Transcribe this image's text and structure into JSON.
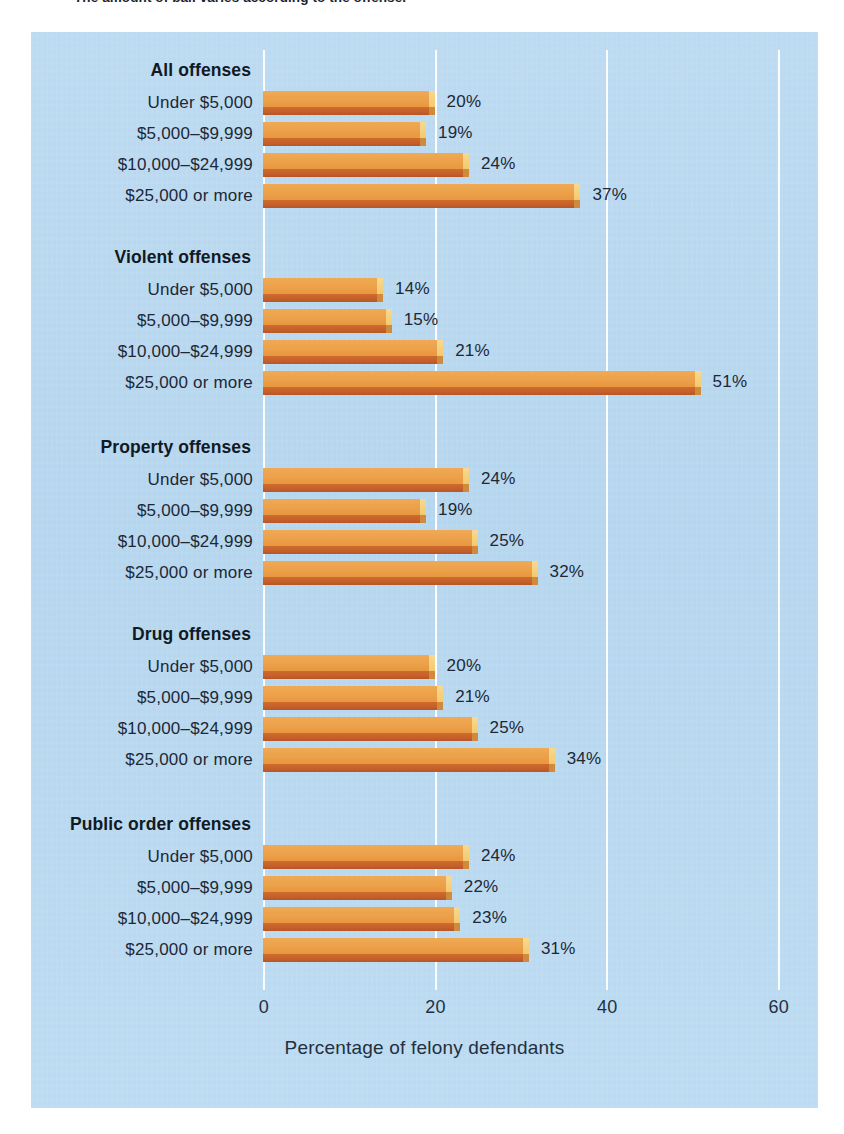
{
  "caption": {
    "text": "The amount of bail varies according to the offense."
  },
  "colors": {
    "panel_background": "#b9d9f0",
    "bar_top": "#eca14a",
    "bar_front": "#c4602a",
    "bar_cap": "#f3c96f",
    "gridline": "#ffffff",
    "text": "#1d2836"
  },
  "axis": {
    "title": "Percentage of felony defendants",
    "ticks": [
      "0",
      "20",
      "40",
      "60"
    ]
  },
  "chart_data": {
    "type": "bar",
    "orientation": "horizontal",
    "title": "The amount of bail varies according to the offense.",
    "xlabel": "Percentage of felony defendants",
    "ylabel": "",
    "xlim": [
      0,
      60
    ],
    "xticks": [
      0,
      20,
      40,
      60
    ],
    "grid": true,
    "legend": "none",
    "value_suffix": "%",
    "categories": [
      "Under $5,000",
      "$5,000–$9,999",
      "$10,000–$24,999",
      "$25,000 or more"
    ],
    "groups": [
      {
        "name": "All offenses",
        "bars": [
          {
            "label": "Under $5,000",
            "value": 20,
            "value_label": "20%"
          },
          {
            "label": "$5,000–$9,999",
            "value": 19,
            "value_label": "19%"
          },
          {
            "label": "$10,000–$24,999",
            "value": 24,
            "value_label": "24%"
          },
          {
            "label": "$25,000 or more",
            "value": 37,
            "value_label": "37%"
          }
        ]
      },
      {
        "name": "Violent offenses",
        "bars": [
          {
            "label": "Under $5,000",
            "value": 14,
            "value_label": "14%"
          },
          {
            "label": "$5,000–$9,999",
            "value": 15,
            "value_label": "15%"
          },
          {
            "label": "$10,000–$24,999",
            "value": 21,
            "value_label": "21%"
          },
          {
            "label": "$25,000 or more",
            "value": 51,
            "value_label": "51%"
          }
        ]
      },
      {
        "name": "Property offenses",
        "bars": [
          {
            "label": "Under $5,000",
            "value": 24,
            "value_label": "24%"
          },
          {
            "label": "$5,000–$9,999",
            "value": 19,
            "value_label": "19%"
          },
          {
            "label": "$10,000–$24,999",
            "value": 25,
            "value_label": "25%"
          },
          {
            "label": "$25,000 or more",
            "value": 32,
            "value_label": "32%"
          }
        ]
      },
      {
        "name": "Drug offenses",
        "bars": [
          {
            "label": "Under $5,000",
            "value": 20,
            "value_label": "20%"
          },
          {
            "label": "$5,000–$9,999",
            "value": 21,
            "value_label": "21%"
          },
          {
            "label": "$10,000–$24,999",
            "value": 25,
            "value_label": "25%"
          },
          {
            "label": "$25,000 or more",
            "value": 34,
            "value_label": "34%"
          }
        ]
      },
      {
        "name": "Public order offenses",
        "bars": [
          {
            "label": "Under $5,000",
            "value": 24,
            "value_label": "24%"
          },
          {
            "label": "$5,000–$9,999",
            "value": 22,
            "value_label": "22%"
          },
          {
            "label": "$10,000–$24,999",
            "value": 23,
            "value_label": "23%"
          },
          {
            "label": "$25,000 or more",
            "value": 31,
            "value_label": "31%"
          }
        ]
      }
    ]
  },
  "layout": {
    "x_origin_px": 232,
    "px_per_unit": 8.58,
    "group_tops": [
      28,
      215,
      405,
      592,
      782
    ],
    "title_offset": 0,
    "first_row_offset": 30,
    "row_pitch": 31
  }
}
